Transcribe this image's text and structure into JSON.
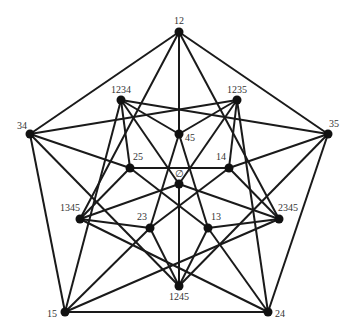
{
  "diagram": {
    "type": "graph",
    "colors": {
      "edge": "#1a1a1a",
      "node": "#111111",
      "label": "#333333",
      "background": "#ffffff"
    },
    "nodes": [
      {
        "id": "12",
        "label": "12",
        "x": 179,
        "y": 32,
        "lx": 179,
        "ly": 24,
        "anchor": "middle"
      },
      {
        "id": "34",
        "label": "34",
        "x": 30,
        "y": 134,
        "lx": 22,
        "ly": 129,
        "anchor": "middle"
      },
      {
        "id": "35",
        "label": "35",
        "x": 328,
        "y": 134,
        "lx": 334,
        "ly": 127,
        "anchor": "middle"
      },
      {
        "id": "15",
        "label": "15",
        "x": 65,
        "y": 312,
        "lx": 52,
        "ly": 317,
        "anchor": "middle"
      },
      {
        "id": "24",
        "label": "24",
        "x": 268,
        "y": 312,
        "lx": 280,
        "ly": 317,
        "anchor": "middle"
      },
      {
        "id": "1234",
        "label": "1234",
        "x": 121,
        "y": 100,
        "lx": 121,
        "ly": 93,
        "anchor": "middle"
      },
      {
        "id": "1235",
        "label": "1235",
        "x": 237,
        "y": 100,
        "lx": 237,
        "ly": 93,
        "anchor": "middle"
      },
      {
        "id": "1345",
        "label": "1345",
        "x": 80,
        "y": 219,
        "lx": 70,
        "ly": 211,
        "anchor": "middle"
      },
      {
        "id": "2345",
        "label": "2345",
        "x": 279,
        "y": 219,
        "lx": 288,
        "ly": 211,
        "anchor": "middle"
      },
      {
        "id": "1245",
        "label": "1245",
        "x": 179,
        "y": 286,
        "lx": 179,
        "ly": 300,
        "anchor": "middle"
      },
      {
        "id": "45",
        "label": "45",
        "x": 179,
        "y": 134,
        "lx": 190,
        "ly": 141,
        "anchor": "middle"
      },
      {
        "id": "25",
        "label": "25",
        "x": 130,
        "y": 168,
        "lx": 138,
        "ly": 160,
        "anchor": "middle"
      },
      {
        "id": "14",
        "label": "14",
        "x": 229,
        "y": 168,
        "lx": 221,
        "ly": 160,
        "anchor": "middle"
      },
      {
        "id": "empty",
        "label": "∅",
        "x": 179,
        "y": 184,
        "lx": 179,
        "ly": 177,
        "anchor": "middle"
      },
      {
        "id": "23",
        "label": "23",
        "x": 150,
        "y": 228,
        "lx": 142,
        "ly": 220,
        "anchor": "middle"
      },
      {
        "id": "13",
        "label": "13",
        "x": 208,
        "y": 228,
        "lx": 216,
        "ly": 220,
        "anchor": "middle"
      }
    ],
    "edges": [
      [
        "empty",
        "1234"
      ],
      [
        "empty",
        "1235"
      ],
      [
        "empty",
        "1245"
      ],
      [
        "empty",
        "1345"
      ],
      [
        "empty",
        "2345"
      ],
      [
        "12",
        "34"
      ],
      [
        "12",
        "35"
      ],
      [
        "12",
        "45"
      ],
      [
        "12",
        "1345"
      ],
      [
        "12",
        "2345"
      ],
      [
        "13",
        "24"
      ],
      [
        "13",
        "25"
      ],
      [
        "13",
        "45"
      ],
      [
        "13",
        "1245"
      ],
      [
        "13",
        "2345"
      ],
      [
        "14",
        "23"
      ],
      [
        "14",
        "25"
      ],
      [
        "14",
        "35"
      ],
      [
        "14",
        "1235"
      ],
      [
        "14",
        "2345"
      ],
      [
        "15",
        "23"
      ],
      [
        "15",
        "24"
      ],
      [
        "15",
        "34"
      ],
      [
        "15",
        "1234"
      ],
      [
        "15",
        "2345"
      ],
      [
        "23",
        "45"
      ],
      [
        "23",
        "1245"
      ],
      [
        "23",
        "1345"
      ],
      [
        "24",
        "15"
      ],
      [
        "24",
        "35"
      ],
      [
        "24",
        "1235"
      ],
      [
        "24",
        "1345"
      ],
      [
        "25",
        "34"
      ],
      [
        "25",
        "1234"
      ],
      [
        "25",
        "1345"
      ],
      [
        "34",
        "1245"
      ],
      [
        "34",
        "1235"
      ],
      [
        "35",
        "1234"
      ],
      [
        "35",
        "1245"
      ],
      [
        "45",
        "1234"
      ],
      [
        "45",
        "1235"
      ]
    ]
  }
}
